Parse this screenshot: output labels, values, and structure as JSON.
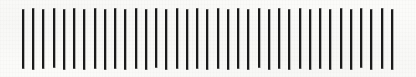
{
  "figure": {
    "type": "tally-stroke-pattern",
    "title": "",
    "caption": "",
    "canvas": {
      "width": 416,
      "height": 77,
      "background_color": "#fbfbf9"
    },
    "strokes": {
      "count": 37,
      "color": "#1a1a1a",
      "thickness_px": 2,
      "first_x": 22,
      "last_x": 391,
      "nominal_spacing_px": 10.25,
      "nominal_top_y": 8,
      "nominal_bottom_y": 70,
      "items": [
        {
          "x": 22,
          "top": 9,
          "bottom": 69,
          "width": 2
        },
        {
          "x": 32,
          "top": 8,
          "bottom": 70,
          "width": 2
        },
        {
          "x": 42,
          "top": 9,
          "bottom": 69,
          "width": 2
        },
        {
          "x": 53,
          "top": 8,
          "bottom": 68,
          "width": 2
        },
        {
          "x": 63,
          "top": 9,
          "bottom": 70,
          "width": 2
        },
        {
          "x": 73,
          "top": 8,
          "bottom": 69,
          "width": 2
        },
        {
          "x": 83,
          "top": 9,
          "bottom": 70,
          "width": 2
        },
        {
          "x": 94,
          "top": 8,
          "bottom": 69,
          "width": 2
        },
        {
          "x": 104,
          "top": 9,
          "bottom": 70,
          "width": 2
        },
        {
          "x": 114,
          "top": 8,
          "bottom": 69,
          "width": 2
        },
        {
          "x": 124,
          "top": 9,
          "bottom": 70,
          "width": 2
        },
        {
          "x": 135,
          "top": 8,
          "bottom": 69,
          "width": 2
        },
        {
          "x": 145,
          "top": 9,
          "bottom": 70,
          "width": 2
        },
        {
          "x": 155,
          "top": 8,
          "bottom": 68,
          "width": 2
        },
        {
          "x": 165,
          "top": 9,
          "bottom": 70,
          "width": 2
        },
        {
          "x": 176,
          "top": 8,
          "bottom": 69,
          "width": 2
        },
        {
          "x": 186,
          "top": 9,
          "bottom": 70,
          "width": 2
        },
        {
          "x": 196,
          "top": 8,
          "bottom": 69,
          "width": 2
        },
        {
          "x": 206,
          "top": 9,
          "bottom": 70,
          "width": 2
        },
        {
          "x": 217,
          "top": 8,
          "bottom": 69,
          "width": 2
        },
        {
          "x": 227,
          "top": 9,
          "bottom": 70,
          "width": 2
        },
        {
          "x": 237,
          "top": 8,
          "bottom": 69,
          "width": 2
        },
        {
          "x": 247,
          "top": 9,
          "bottom": 70,
          "width": 2
        },
        {
          "x": 258,
          "top": 8,
          "bottom": 68,
          "width": 2
        },
        {
          "x": 268,
          "top": 9,
          "bottom": 70,
          "width": 2
        },
        {
          "x": 278,
          "top": 8,
          "bottom": 69,
          "width": 2
        },
        {
          "x": 288,
          "top": 9,
          "bottom": 70,
          "width": 2
        },
        {
          "x": 299,
          "top": 8,
          "bottom": 69,
          "width": 2
        },
        {
          "x": 309,
          "top": 9,
          "bottom": 70,
          "width": 2
        },
        {
          "x": 319,
          "top": 8,
          "bottom": 69,
          "width": 2
        },
        {
          "x": 329,
          "top": 9,
          "bottom": 70,
          "width": 2
        },
        {
          "x": 340,
          "top": 8,
          "bottom": 69,
          "width": 2
        },
        {
          "x": 350,
          "top": 9,
          "bottom": 70,
          "width": 2
        },
        {
          "x": 360,
          "top": 8,
          "bottom": 68,
          "width": 2
        },
        {
          "x": 370,
          "top": 9,
          "bottom": 70,
          "width": 2
        },
        {
          "x": 381,
          "top": 8,
          "bottom": 69,
          "width": 2
        },
        {
          "x": 391,
          "top": 9,
          "bottom": 70,
          "width": 2
        }
      ]
    }
  }
}
